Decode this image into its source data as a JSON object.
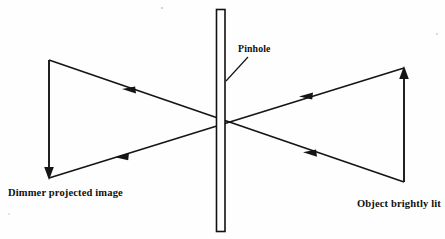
{
  "diagram": {
    "background_color": "#fefefe",
    "ink_color": "#151515",
    "labels": {
      "pinhole": "Pinhole",
      "image": "Dimmer projected image",
      "object": "Object brightly lit"
    },
    "elements": {
      "barrier_name": "pinhole barrier screen",
      "object_arrow_direction": "up",
      "image_arrow_direction": "down",
      "ray_direction": "right-to-left"
    },
    "geometry": {
      "barrier_x": 216,
      "barrier_width": 9,
      "barrier_top": 9,
      "barrier_bottom": 232,
      "pinhole_x": 220,
      "pinhole_y": 127,
      "object_x": 404,
      "object_top_y": 68,
      "object_base_y": 182,
      "image_x": 49,
      "image_top_y": 60,
      "image_tip_y": 178
    }
  }
}
